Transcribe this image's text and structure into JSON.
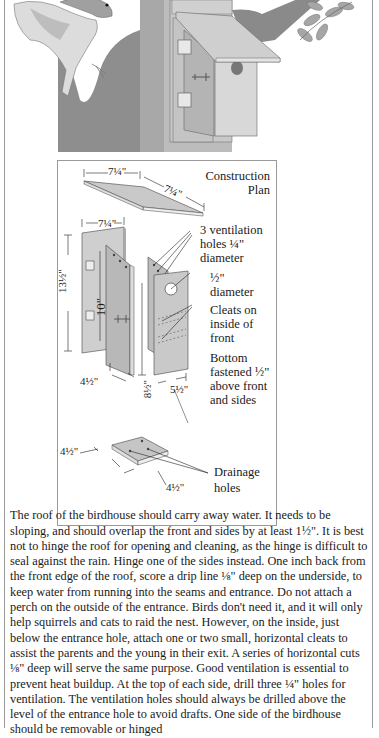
{
  "illustration": {
    "subject": "Bird perched near a birdhouse mounted on a tree trunk with leafy branch",
    "icons": [
      "bird-icon",
      "birdhouse-icon",
      "tree-trunk-icon",
      "leaf-branch-icon",
      "hinge-icon",
      "latch-icon"
    ]
  },
  "plan": {
    "title_line1": "Construction",
    "title_line2": "Plan",
    "roof_dim_width": "7¼\"",
    "roof_dim_depth": "7¼\"",
    "back_dim_width": "7¼\"",
    "back_dim_height": "13½\"",
    "side_dim_height": "10\"",
    "side_dim_width": "4½\"",
    "front_dim_height": "8½\"",
    "front_dim_width": "5½\"",
    "bottom_dim_left": "4½\"",
    "bottom_dim_right": "4½\"",
    "callouts": [
      {
        "lines": [
          "3 ventilation",
          "holes ¼\"",
          "diameter"
        ]
      },
      {
        "lines": [
          "½\"",
          "diameter"
        ]
      },
      {
        "lines": [
          "Cleats on",
          "inside of",
          "front"
        ]
      },
      {
        "lines": [
          "Bottom",
          "fastened ½\"",
          "above front",
          "and sides"
        ]
      },
      {
        "lines": [
          "Drainage",
          "holes"
        ]
      }
    ]
  },
  "article": {
    "paragraph": "The roof of the birdhouse should carry away water. It needs to be sloping, and should overlap the front and sides by at least 1½\". It is best not to hinge the roof for opening and cleaning, as the hinge is difficult to seal against the rain. Hinge one of the sides instead. One inch back from the front edge of the roof, score a drip line ⅛\" deep on the underside, to keep water from running into the seams and entrance. Do not attach a perch on the outside of the entrance. Birds don't need it, and it will only help squirrels and cats to raid the nest. However, on the inside, just below the entrance hole, attach one or two small, horizontal cleats to assist the parents and the young in their exit. A series of horizontal cuts ⅛\" deep will serve the same purpose. Good ventilation is essential to prevent heat buildup. At the top of each side, drill three ¼\" holes for ventilation. The ventilation holes should always be drilled above the level of the entrance hole to avoid drafts. One side of the birdhouse should be removable or hinged"
  }
}
